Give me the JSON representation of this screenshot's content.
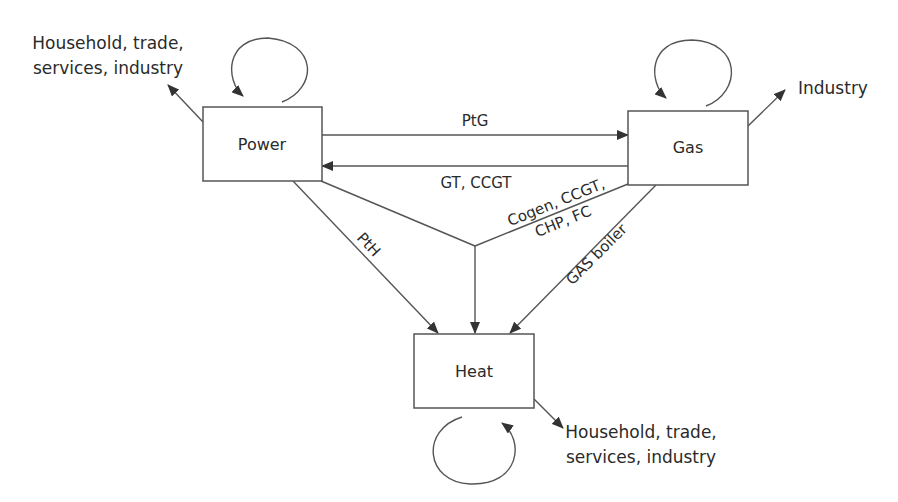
{
  "diagram": {
    "type": "energy-system-coupling",
    "nodes": [
      {
        "id": "power",
        "label": "Power"
      },
      {
        "id": "gas",
        "label": "Gas"
      },
      {
        "id": "heat",
        "label": "Heat"
      }
    ],
    "external": {
      "power_out_line1": "Household, trade,",
      "power_out_line2": "services, industry",
      "gas_out": "Industry",
      "heat_out_line1": "Household, trade,",
      "heat_out_line2": "services, industry"
    },
    "edges": {
      "power_to_gas": "PtG",
      "gas_to_power": "GT, CCGT",
      "cogen_line1": "Cogen, CCGT,",
      "cogen_line2": "CHP, FC",
      "power_to_heat": "PtH",
      "gas_to_heat": "GAS boiler"
    },
    "colors": {
      "stroke": "#555555",
      "text": "#2a2a2a",
      "background": "#ffffff"
    }
  }
}
